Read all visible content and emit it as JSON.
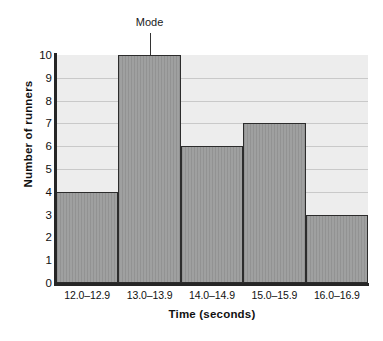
{
  "chart_data": {
    "type": "bar",
    "title": "",
    "subtitle": "",
    "categories": [
      "12.0–12.9",
      "13.0–13.9",
      "14.0–14.9",
      "15.0–15.9",
      "16.0–16.9"
    ],
    "values": [
      4,
      10,
      6,
      7,
      3
    ],
    "xlabel": "Time (seconds)",
    "ylabel": "Number of runners",
    "ylim": [
      0,
      10
    ],
    "ytick_labels": [
      "10",
      "9",
      "8",
      "7",
      "6",
      "5",
      "4",
      "3",
      "2",
      "1",
      "0"
    ],
    "ytick_values": [
      10,
      9,
      8,
      7,
      6,
      5,
      4,
      3,
      2,
      1,
      0
    ],
    "grid": true,
    "grid_axis": "y",
    "legend": false,
    "annotations": [
      {
        "text": "Mode",
        "target_category": "13.0–13.9",
        "target_value": 10,
        "style": "leader-line-above"
      }
    ],
    "colors": {
      "bar_fill": "#9a9b9b",
      "bar_border": "#2c2c2c",
      "plot_background": "#ededed",
      "gridline": "#c9c9c9",
      "axis": "#262626",
      "text": "#111111"
    }
  }
}
